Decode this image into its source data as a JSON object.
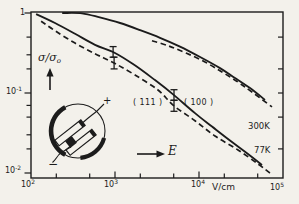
{
  "figure": {
    "background": "#f3f1eb",
    "ink": "#1c1c1c"
  },
  "axes": {
    "x": {
      "label": "V/cm",
      "scale": "log",
      "range": [
        100,
        100000
      ],
      "tick_labels": [
        {
          "base": "10",
          "exp": "2",
          "value": 100
        },
        {
          "base": "10",
          "exp": "3",
          "value": 1000
        },
        {
          "base": "10",
          "exp": "4",
          "value": 10000
        },
        {
          "base": "10",
          "exp": "5",
          "value": 100000
        }
      ],
      "major_ticks": [
        1000,
        10000
      ],
      "minor_ticks": [
        200,
        500,
        2000,
        5000,
        20000,
        50000
      ]
    },
    "y": {
      "label_base": "σ/σ",
      "label_sub": "o",
      "scale": "log",
      "range": [
        0.01,
        1
      ],
      "tick_labels": [
        {
          "base": "1",
          "exp": "",
          "value": 1
        },
        {
          "base": "10",
          "exp": "-1",
          "value": 0.1
        },
        {
          "base": "10",
          "exp": "-2",
          "value": 0.01
        }
      ],
      "major_ticks": [
        1,
        0.1,
        0.01
      ],
      "minor_ticks_left": [
        0.5,
        0.3,
        0.2,
        0.07,
        0.05,
        0.03,
        0.02
      ],
      "minor_ticks_right": [
        0.5,
        0.2,
        0.1,
        0.05,
        0.02
      ]
    }
  },
  "chart_data": {
    "type": "line",
    "title": "",
    "xlabel": "V/cm",
    "ylabel": "σ/σo",
    "xscale": "log",
    "yscale": "log",
    "xlim": [
      100,
      100000
    ],
    "ylim": [
      0.01,
      1
    ],
    "grid": false,
    "series": [
      {
        "name": "300K-solid",
        "temperature": "300K",
        "style": "solid",
        "points": [
          [
            235,
            1.0
          ],
          [
            405,
            0.99
          ],
          [
            660,
            0.88
          ],
          [
            1150,
            0.75
          ],
          [
            1990,
            0.61
          ],
          [
            3430,
            0.49
          ],
          [
            5940,
            0.38
          ],
          [
            10300,
            0.282
          ],
          [
            17800,
            0.205
          ],
          [
            26800,
            0.154
          ],
          [
            40500,
            0.115
          ],
          [
            61000,
            0.082
          ]
        ]
      },
      {
        "name": "300K-dashed",
        "temperature": "300K",
        "style": "dashed",
        "points": [
          [
            2760,
            0.45
          ],
          [
            4280,
            0.39
          ],
          [
            7000,
            0.316
          ],
          [
            11800,
            0.244
          ],
          [
            18800,
            0.183
          ],
          [
            29100,
            0.137
          ],
          [
            42700,
            0.103
          ],
          [
            74000,
            0.067
          ]
        ]
      },
      {
        "name": "77K-solid",
        "temperature": "77K",
        "style": "solid",
        "points": [
          [
            115,
            0.97
          ],
          [
            193,
            0.75
          ],
          [
            334,
            0.55
          ],
          [
            578,
            0.4
          ],
          [
            950,
            0.325
          ],
          [
            1640,
            0.23
          ],
          [
            2990,
            0.145
          ],
          [
            5040,
            0.094
          ],
          [
            8950,
            0.056
          ],
          [
            14300,
            0.038
          ],
          [
            24700,
            0.0244
          ],
          [
            38300,
            0.0173
          ],
          [
            56200,
            0.0126
          ]
        ]
      },
      {
        "name": "77K-dashed",
        "temperature": "77K",
        "style": "dashed",
        "points": [
          [
            132,
            0.79
          ],
          [
            193,
            0.6
          ],
          [
            334,
            0.42
          ],
          [
            578,
            0.31
          ],
          [
            975,
            0.237
          ],
          [
            1730,
            0.168
          ],
          [
            3250,
            0.109
          ],
          [
            5040,
            0.069
          ],
          [
            8950,
            0.045
          ],
          [
            15500,
            0.029
          ],
          [
            29100,
            0.0194
          ],
          [
            50300,
            0.013
          ],
          [
            70000,
            0.01
          ]
        ]
      }
    ],
    "error_bars": [
      {
        "series": "77K-solid",
        "x": 950,
        "y": 0.325,
        "y_lo": 0.28,
        "y_hi": 0.38
      },
      {
        "series": "77K-dashed",
        "x": 975,
        "y": 0.237,
        "y_lo": 0.2,
        "y_hi": 0.28
      },
      {
        "series": "77K-solid",
        "x": 5040,
        "y": 0.094,
        "y_lo": 0.081,
        "y_hi": 0.11
      },
      {
        "series": "77K-dashed",
        "x": 5040,
        "y": 0.069,
        "y_lo": 0.059,
        "y_hi": 0.081
      }
    ],
    "annotations": {
      "orientation_111": "( 111 )",
      "orientation_100": "( 100 )",
      "temp_300K": "300K",
      "temp_77K": "77K",
      "efield": "E"
    }
  },
  "inset": {
    "plus": "+",
    "minus": "−"
  }
}
